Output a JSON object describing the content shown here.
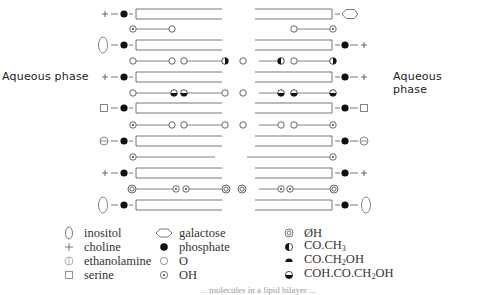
{
  "labels": {
    "left_phase": "Aqueous phase",
    "right_phase": "Aqueous phase"
  },
  "legend": {
    "col1": [
      {
        "icon": "inositol-icon",
        "label": "inositol"
      },
      {
        "icon": "choline-icon",
        "label": "choline"
      },
      {
        "icon": "ethanolamine-icon",
        "label": "ethanolamine"
      },
      {
        "icon": "serine-icon",
        "label": "serine"
      }
    ],
    "col2": [
      {
        "icon": "galactose-icon",
        "label": "galactose"
      },
      {
        "icon": "phosphate-icon",
        "label": "phosphate"
      },
      {
        "icon": "oxygen-icon",
        "label": "O"
      },
      {
        "icon": "hydroxyl-icon",
        "label": "OH"
      }
    ],
    "col3": [
      {
        "icon": "phenolic-oh-icon",
        "label": "ØH"
      },
      {
        "icon": "acetyl-icon",
        "label_main": "CO.CH",
        "label_sub": "3",
        "label_tail": ""
      },
      {
        "icon": "hydroxyacetyl-icon",
        "label_main": "CO.CH",
        "label_sub": "2",
        "label_tail": "OH"
      },
      {
        "icon": "dihydroxyacetone-icon",
        "label_main": "COH.CO.CH",
        "label_sub": "2",
        "label_tail": "OH"
      }
    ]
  },
  "rows": {
    "bilayer_left_headgroups": [
      "choline",
      "inositol",
      "choline",
      "serine",
      "ethanolamine",
      "choline",
      "inositol"
    ],
    "bilayer_right_headgroups": [
      "galactose",
      "choline",
      "choline",
      "serine",
      "ethanolamine",
      "choline",
      "inositol"
    ],
    "interleaved": [
      {
        "left": [
          "OH",
          "O"
        ],
        "right": [
          "O",
          "OH"
        ]
      },
      {
        "left": [
          "O",
          "O",
          "O",
          "CO.CH3"
        ],
        "right": [
          "O",
          "CO.CH3",
          "O",
          "CO.CH3"
        ]
      },
      {
        "left": [
          "O",
          "COH.CO.CH2OH",
          "COH.CO.CH2OH",
          "O"
        ],
        "right": [
          "O",
          "COH.CO.CH2OH",
          "COH.CO.CH2OH",
          "COH.CO.CH2OH"
        ]
      },
      {
        "left": [
          "OH",
          "O",
          "O",
          "O"
        ],
        "right": [
          "O",
          "O",
          "O",
          "OH"
        ]
      },
      {
        "left": [
          "OH"
        ],
        "right": [
          "OH"
        ]
      },
      {
        "left": [
          "ØH",
          "OH",
          "OH",
          "ØH"
        ],
        "right": [
          "ØH",
          "OH",
          "OH",
          "ØH"
        ]
      }
    ]
  },
  "caption": "... molecules in a lipid bilayer ..."
}
